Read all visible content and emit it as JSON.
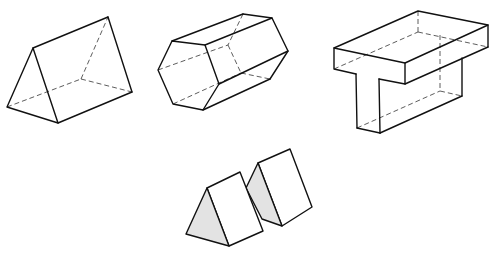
{
  "figure": {
    "colors": {
      "line": "#111111",
      "hidden_line": "#333333",
      "shaded_face": "#e3e3e3",
      "background": "#ffffff"
    },
    "solids": [
      {
        "id": "triangular-prism",
        "label": "Triangular prism",
        "style": "wireframe-with-hidden-edges"
      },
      {
        "id": "hexagonal-prism",
        "label": "Hexagonal prism",
        "style": "wireframe-with-hidden-edges"
      },
      {
        "id": "t-beam",
        "label": "T-shaped solid",
        "style": "wireframe-with-hidden-edges"
      },
      {
        "id": "twin-triangular-prisms",
        "label": "Two triangular prisms",
        "style": "shaded-end-faces"
      }
    ]
  }
}
